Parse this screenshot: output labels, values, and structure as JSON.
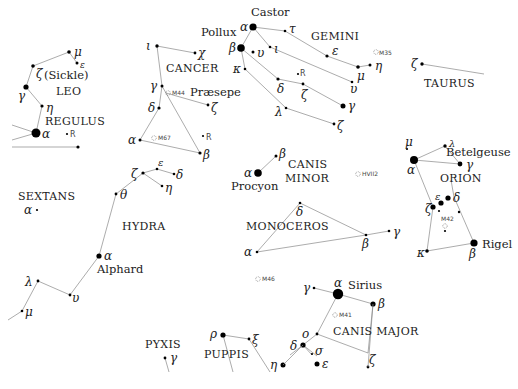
{
  "constellations": {
    "leo": "LEO",
    "sickle": "(Sickle)",
    "regulus": "REGULUS",
    "cancer": "CANCER",
    "gemini": "GEMINI",
    "taurus": "TAURUS",
    "canis_minor_1": "CANIS",
    "canis_minor_2": "MINOR",
    "orion": "ORION",
    "sextans": "SEXTANS",
    "hydra": "HYDRA",
    "monoceros": "MONOCEROS",
    "canis_major": "CANIS MAJOR",
    "pyxis": "PYXIS",
    "puppis": "PUPPIS"
  },
  "star_names": {
    "castor": "Castor",
    "pollux": "Pollux",
    "praesepe": "Præsepe",
    "procyon": "Procyon",
    "betelgeuse": "Betelgeuse",
    "rigel": "Rigel",
    "alphard": "Alphard",
    "sirius": "Sirius"
  },
  "objects": {
    "m35": "M35",
    "m44": "M44",
    "m67": "M67",
    "m42": "M42",
    "m46": "M46",
    "m41": "M41",
    "hvii2": "HVII2",
    "r_leo": "R",
    "r_cancer": "R",
    "r_gemini": "R"
  },
  "greek": {
    "alpha": "α",
    "beta": "β",
    "gamma": "γ",
    "delta": "δ",
    "epsilon": "ε",
    "zeta": "ζ",
    "eta": "η",
    "theta": "θ",
    "iota": "ι",
    "kappa": "κ",
    "lambda": "λ",
    "mu": "μ",
    "nu": "ν",
    "xi": "ξ",
    "omicron": "ο",
    "rho": "ρ",
    "sigma": "σ",
    "tau": "τ",
    "upsilon": "υ",
    "chi": "χ"
  }
}
